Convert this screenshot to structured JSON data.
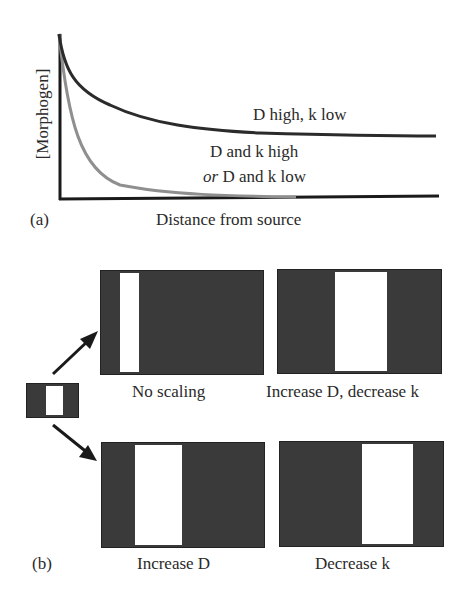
{
  "panel_a": {
    "label": "(a)",
    "y_axis_label": "[Morphogen]",
    "x_axis_label": "Distance from source",
    "curves": [
      {
        "name": "D high, k low",
        "label": "D high, k low",
        "color": "#2b2b2b"
      },
      {
        "name": "D and k high or D and k low",
        "label_line1": "D and k high",
        "label_line2_italic": "or",
        "label_line2_rest": " D and k low",
        "color": "#8f8f8f"
      }
    ]
  },
  "panel_b": {
    "label": "(b)",
    "source_pattern": {
      "name": "initial pattern"
    },
    "outcomes": [
      {
        "label": "No scaling"
      },
      {
        "label": "Increase D, decrease k"
      },
      {
        "label": "Increase D"
      },
      {
        "label": "Decrease k"
      }
    ]
  },
  "colors": {
    "dark_fill": "#3a3a3a",
    "axis": "#1a1a1a",
    "gray_curve": "#8f8f8f",
    "dark_curve": "#2b2b2b"
  }
}
